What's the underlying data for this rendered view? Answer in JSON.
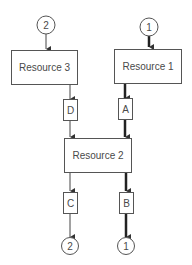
{
  "diagram": {
    "resources": [
      {
        "id": "r3",
        "label": "Resource 3"
      },
      {
        "id": "r1",
        "label": "Resource 1"
      },
      {
        "id": "r2",
        "label": "Resource 2"
      }
    ],
    "locks": [
      {
        "id": "D",
        "label": "D"
      },
      {
        "id": "A",
        "label": "A"
      },
      {
        "id": "C",
        "label": "C"
      },
      {
        "id": "B",
        "label": "B"
      }
    ],
    "connectors": {
      "top_left": "2",
      "top_right": "1",
      "bottom_left": "2",
      "bottom_right": "1"
    },
    "colors": {
      "line": "#3a3a3a",
      "box_border": "#555555",
      "text": "#4a4a4a"
    }
  }
}
